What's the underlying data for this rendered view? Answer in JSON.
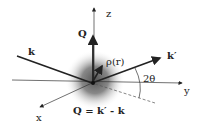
{
  "diagram": {
    "axes": {
      "x": "x",
      "y": "y",
      "z": "z"
    },
    "vectors": {
      "incident": "k",
      "scattered": "k′",
      "momentum_transfer": "Q"
    },
    "density_label": "ρ(r)",
    "angle_label": "2θ",
    "equation": "Q = k′ - k"
  }
}
